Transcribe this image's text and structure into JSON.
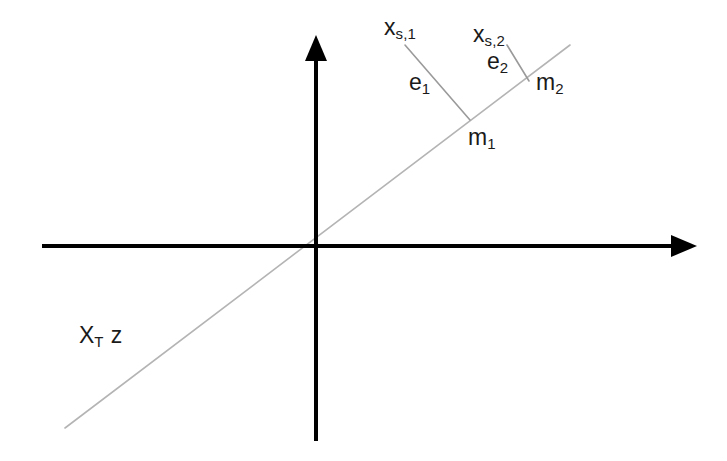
{
  "diagram": {
    "background_color": "#ffffff",
    "axis_color": "#000000",
    "subspace_line_color": "#b0b0b0",
    "residual_line_color": "#9a9a9a",
    "label_color": "#1a1a1a"
  },
  "axes": {
    "horizontal": {
      "name": "horizontal-axis",
      "x1": 42,
      "y1": 246,
      "x2": 697,
      "y2": 246,
      "arrow_end": "right",
      "stroke_width": 4
    },
    "vertical": {
      "name": "vertical-axis",
      "x1": 316,
      "y1": 441,
      "x2": 316,
      "y2": 35,
      "arrow_end": "top",
      "stroke_width": 4
    },
    "origin": {
      "x": 316,
      "y": 246
    }
  },
  "subspace_line": {
    "label": "X_T z",
    "label_parts": {
      "base1": "X",
      "sub1": "T",
      "base2": "z"
    },
    "x1": 65,
    "y1": 428,
    "x2": 570,
    "y2": 45,
    "stroke_width": 1.6
  },
  "projections": [
    {
      "id": "proj-1",
      "source_label": "x_s,1",
      "source_label_parts": {
        "base": "x",
        "sub": "s,1"
      },
      "residual_label": "e",
      "residual_sub": "1",
      "foot_label": "m",
      "foot_sub": "1",
      "source_point": {
        "x": 405,
        "y": 45
      },
      "foot_point": {
        "x": 470,
        "y": 120
      },
      "stroke_width": 1.6
    },
    {
      "id": "proj-2",
      "source_label": "x_s,2",
      "source_label_parts": {
        "base": "x",
        "sub": "s,2"
      },
      "residual_label": "e",
      "residual_sub": "2",
      "foot_label": "m",
      "foot_sub": "2",
      "source_point": {
        "x": 507,
        "y": 45
      },
      "foot_point": {
        "x": 529,
        "y": 81
      },
      "stroke_width": 1.6
    }
  ],
  "labels": {
    "xs1": {
      "base": "x",
      "sub": "s,1"
    },
    "xs2": {
      "base": "x",
      "sub": "s,2"
    },
    "e1": {
      "base": "e",
      "sub": "1"
    },
    "e2": {
      "base": "e",
      "sub": "2"
    },
    "m1": {
      "base": "m",
      "sub": "1"
    },
    "m2": {
      "base": "m",
      "sub": "2"
    },
    "xtz": {
      "base1": "X",
      "sub1": "T",
      "base2": "z"
    }
  }
}
